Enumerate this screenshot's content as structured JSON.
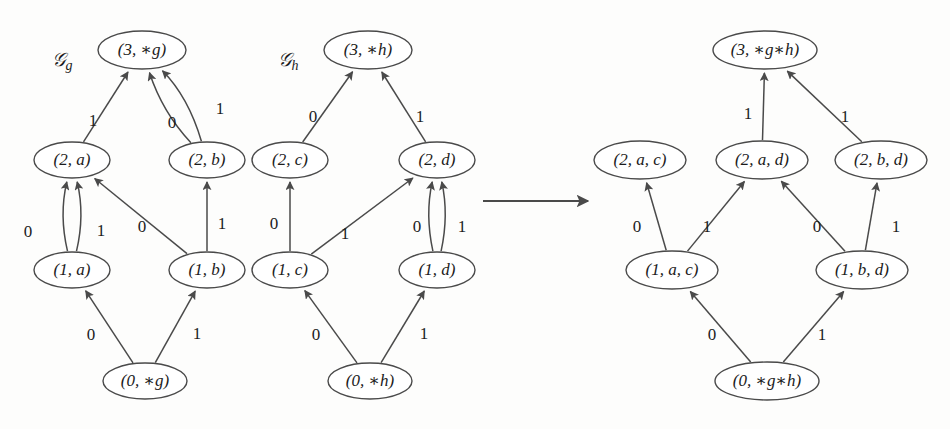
{
  "figure": {
    "type": "directed-graph-product-diagram",
    "background_color": "#fdfdfc",
    "stroke_color": "#4a4a4a",
    "text_color": "#1c1c1c"
  },
  "graphs": [
    {
      "id": "g",
      "caption": "\u0001d4a2g",
      "caption_display": "𝒢g",
      "caption_base": "𝒢",
      "caption_sub": "g",
      "caption_x": 62,
      "caption_y": 62,
      "nodes": [
        {
          "id": "g3",
          "label": "(3, ∗g)",
          "x": 142,
          "y": 50,
          "rx": 44,
          "ry": 19
        },
        {
          "id": "g2a",
          "label": "(2, a)",
          "x": 72,
          "y": 160,
          "rx": 38,
          "ry": 18
        },
        {
          "id": "g2b",
          "label": "(2, b)",
          "x": 207,
          "y": 160,
          "rx": 38,
          "ry": 18
        },
        {
          "id": "g1a",
          "label": "(1, a)",
          "x": 72,
          "y": 270,
          "rx": 38,
          "ry": 18
        },
        {
          "id": "g1b",
          "label": "(1, b)",
          "x": 207,
          "y": 270,
          "rx": 38,
          "ry": 18
        },
        {
          "id": "g0",
          "label": "(0, ∗g)",
          "x": 145,
          "y": 381,
          "rx": 42,
          "ry": 18
        }
      ],
      "edges": [
        {
          "from": "g2a",
          "to": "g3",
          "label": "1",
          "lx": 93,
          "ly": 122,
          "curve": 0
        },
        {
          "from": "g2b",
          "to": "g3",
          "label": "0",
          "lx": 172,
          "ly": 124,
          "curve": -14
        },
        {
          "from": "g2b",
          "to": "g3",
          "label": "1",
          "lx": 220,
          "ly": 110,
          "curve": 16
        },
        {
          "from": "g1a",
          "to": "g2a",
          "label": "0",
          "lx": 28,
          "ly": 233,
          "curve": -13
        },
        {
          "from": "g1a",
          "to": "g2a",
          "label": "1",
          "lx": 101,
          "ly": 232,
          "curve": 13
        },
        {
          "from": "g1b",
          "to": "g2a",
          "label": "0",
          "lx": 142,
          "ly": 228,
          "curve": 0
        },
        {
          "from": "g1b",
          "to": "g2b",
          "label": "1",
          "lx": 222,
          "ly": 225,
          "curve": 0
        },
        {
          "from": "g0",
          "to": "g1a",
          "label": "0",
          "lx": 91,
          "ly": 336,
          "curve": 0
        },
        {
          "from": "g0",
          "to": "g1b",
          "label": "1",
          "lx": 197,
          "ly": 335,
          "curve": 0
        }
      ]
    },
    {
      "id": "h",
      "caption_base": "𝒢",
      "caption_sub": "h",
      "caption_x": 288,
      "caption_y": 62,
      "nodes": [
        {
          "id": "h3",
          "label": "(3, ∗h)",
          "x": 368,
          "y": 50,
          "rx": 44,
          "ry": 19
        },
        {
          "id": "h2c",
          "label": "(2, c)",
          "x": 290,
          "y": 160,
          "rx": 38,
          "ry": 18
        },
        {
          "id": "h2d",
          "label": "(2, d)",
          "x": 437,
          "y": 160,
          "rx": 38,
          "ry": 18
        },
        {
          "id": "h1c",
          "label": "(1, c)",
          "x": 290,
          "y": 270,
          "rx": 38,
          "ry": 18
        },
        {
          "id": "h1d",
          "label": "(1, d)",
          "x": 437,
          "y": 270,
          "rx": 38,
          "ry": 18
        },
        {
          "id": "h0",
          "label": "(0, ∗h)",
          "x": 370,
          "y": 381,
          "rx": 42,
          "ry": 18
        }
      ],
      "edges": [
        {
          "from": "h2c",
          "to": "h3",
          "label": "0",
          "lx": 313,
          "ly": 118,
          "curve": 0
        },
        {
          "from": "h2d",
          "to": "h3",
          "label": "1",
          "lx": 420,
          "ly": 118,
          "curve": 0
        },
        {
          "from": "h1c",
          "to": "h2c",
          "label": "0",
          "lx": 274,
          "ly": 225,
          "curve": 0
        },
        {
          "from": "h1c",
          "to": "h2d",
          "label": "1",
          "lx": 345,
          "ly": 235,
          "curve": 0
        },
        {
          "from": "h1d",
          "to": "h2d",
          "label": "0",
          "lx": 417,
          "ly": 228,
          "curve": -12
        },
        {
          "from": "h1d",
          "to": "h2d",
          "label": "1",
          "lx": 462,
          "ly": 228,
          "curve": 12
        },
        {
          "from": "h0",
          "to": "h1c",
          "label": "0",
          "lx": 316,
          "ly": 336,
          "curve": 0
        },
        {
          "from": "h0",
          "to": "h1d",
          "label": "1",
          "lx": 424,
          "ly": 335,
          "curve": 0
        }
      ]
    },
    {
      "id": "product",
      "caption_base": "",
      "caption_sub": "",
      "caption_x": 0,
      "caption_y": 0,
      "nodes": [
        {
          "id": "p3",
          "label": "(3, ∗g∗h)",
          "x": 765,
          "y": 50,
          "rx": 52,
          "ry": 19
        },
        {
          "id": "p2ac",
          "label": "(2, a, c)",
          "x": 640,
          "y": 160,
          "rx": 46,
          "ry": 19
        },
        {
          "id": "p2ad",
          "label": "(2, a, d)",
          "x": 762,
          "y": 160,
          "rx": 46,
          "ry": 19
        },
        {
          "id": "p2bd",
          "label": "(2, b, d)",
          "x": 881,
          "y": 160,
          "rx": 46,
          "ry": 19
        },
        {
          "id": "p1ac",
          "label": "(1, a, c)",
          "x": 672,
          "y": 270,
          "rx": 46,
          "ry": 19
        },
        {
          "id": "p1bd",
          "label": "(1, b, d)",
          "x": 862,
          "y": 270,
          "rx": 46,
          "ry": 19
        },
        {
          "id": "p0",
          "label": "(0, ∗g∗h)",
          "x": 767,
          "y": 381,
          "rx": 52,
          "ry": 19
        }
      ],
      "edges": [
        {
          "from": "p2ad",
          "to": "p3",
          "label": "1",
          "lx": 748,
          "ly": 115,
          "curve": 0
        },
        {
          "from": "p2bd",
          "to": "p3",
          "label": "1",
          "lx": 845,
          "ly": 118,
          "curve": 0
        },
        {
          "from": "p1ac",
          "to": "p2ac",
          "label": "0",
          "lx": 637,
          "ly": 228,
          "curve": 0
        },
        {
          "from": "p1ac",
          "to": "p2ad",
          "label": "1",
          "lx": 707,
          "ly": 228,
          "curve": 0
        },
        {
          "from": "p1bd",
          "to": "p2ad",
          "label": "0",
          "lx": 817,
          "ly": 228,
          "curve": 0
        },
        {
          "from": "p1bd",
          "to": "p2bd",
          "label": "1",
          "lx": 896,
          "ly": 228,
          "curve": 0
        },
        {
          "from": "p0",
          "to": "p1ac",
          "label": "0",
          "lx": 712,
          "ly": 336,
          "curve": 0
        },
        {
          "from": "p0",
          "to": "p1bd",
          "label": "1",
          "lx": 822,
          "ly": 336,
          "curve": 0
        }
      ]
    }
  ],
  "transform_arrow": {
    "x1": 483,
    "y1": 201,
    "x2": 588,
    "y2": 201,
    "name": "product-transform-arrow"
  },
  "alphabet": [
    "0",
    "1"
  ]
}
